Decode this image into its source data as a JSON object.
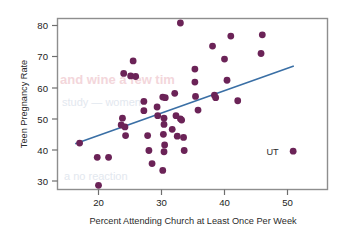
{
  "chart_data": {
    "type": "scatter",
    "title": "",
    "xlabel": "Percent Attending Church at Least Once Per Week",
    "ylabel": "Teen Pregnancy Rate",
    "xlim": [
      14,
      57
    ],
    "ylim": [
      26,
      84
    ],
    "xticks": [
      20,
      30,
      40,
      50
    ],
    "yticks": [
      30,
      40,
      50,
      60,
      70,
      80
    ],
    "grid": false,
    "legend": null,
    "marker_color": "#6b2357",
    "trendline_color": "#3a6fa5",
    "frame_color": "#8e8e8e",
    "points": [
      {
        "x": 17.0,
        "y": 42.2
      },
      {
        "x": 19.8,
        "y": 37.6
      },
      {
        "x": 21.6,
        "y": 37.6
      },
      {
        "x": 20.0,
        "y": 28.6
      },
      {
        "x": 23.6,
        "y": 48.0
      },
      {
        "x": 23.8,
        "y": 50.2
      },
      {
        "x": 24.2,
        "y": 47.4
      },
      {
        "x": 24.3,
        "y": 44.6
      },
      {
        "x": 24.0,
        "y": 64.6
      },
      {
        "x": 25.1,
        "y": 63.8
      },
      {
        "x": 25.9,
        "y": 63.6
      },
      {
        "x": 25.5,
        "y": 68.6
      },
      {
        "x": 27.2,
        "y": 55.6
      },
      {
        "x": 27.2,
        "y": 52.6
      },
      {
        "x": 27.8,
        "y": 44.6
      },
      {
        "x": 28.0,
        "y": 39.8
      },
      {
        "x": 28.5,
        "y": 35.6
      },
      {
        "x": 29.3,
        "y": 53.8
      },
      {
        "x": 29.4,
        "y": 51.0
      },
      {
        "x": 30.2,
        "y": 57.0
      },
      {
        "x": 30.6,
        "y": 56.8
      },
      {
        "x": 30.4,
        "y": 50.2
      },
      {
        "x": 30.4,
        "y": 48.2
      },
      {
        "x": 30.3,
        "y": 45.0
      },
      {
        "x": 30.5,
        "y": 41.6
      },
      {
        "x": 30.4,
        "y": 39.4
      },
      {
        "x": 30.2,
        "y": 33.4
      },
      {
        "x": 31.7,
        "y": 46.6
      },
      {
        "x": 32.1,
        "y": 58.2
      },
      {
        "x": 32.3,
        "y": 51.0
      },
      {
        "x": 32.5,
        "y": 44.4
      },
      {
        "x": 33.0,
        "y": 50.0
      },
      {
        "x": 33.2,
        "y": 49.6
      },
      {
        "x": 33.5,
        "y": 44.0
      },
      {
        "x": 33.6,
        "y": 39.8
      },
      {
        "x": 33.0,
        "y": 80.8
      },
      {
        "x": 35.3,
        "y": 66.0
      },
      {
        "x": 35.3,
        "y": 61.8
      },
      {
        "x": 35.4,
        "y": 57.2
      },
      {
        "x": 35.8,
        "y": 52.8
      },
      {
        "x": 38.1,
        "y": 73.4
      },
      {
        "x": 38.4,
        "y": 57.6
      },
      {
        "x": 38.6,
        "y": 56.8
      },
      {
        "x": 40.0,
        "y": 69.2
      },
      {
        "x": 40.4,
        "y": 62.4
      },
      {
        "x": 41.0,
        "y": 76.6
      },
      {
        "x": 42.1,
        "y": 55.8
      },
      {
        "x": 46.0,
        "y": 77.0
      },
      {
        "x": 45.8,
        "y": 71.0
      },
      {
        "x": 50.9,
        "y": 39.6
      }
    ],
    "trendline": {
      "x1": 16.3,
      "y1": 42.0,
      "x2": 51.0,
      "y2": 67.0
    },
    "annotations": [
      {
        "text": "UT",
        "x": 48.6,
        "y": 39.6,
        "anchor": "end"
      }
    ],
    "bleed_through": [
      {
        "text": "and wine a few tim",
        "x": 60,
        "y": 82
      },
      {
        "text": "study  — women",
        "x": 62,
        "y": 104
      },
      {
        "text": "a  no  reaction",
        "x": 64,
        "y": 178
      }
    ]
  }
}
